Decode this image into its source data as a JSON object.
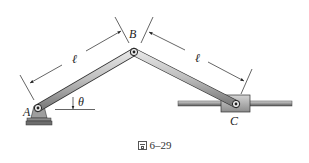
{
  "figure": {
    "caption_prefix": "图",
    "caption_number": "6–29",
    "points": {
      "A": "A",
      "B": "B",
      "C": "C"
    },
    "link_length_label_ab": "ℓ",
    "link_length_label_bc": "ℓ",
    "angle_label": "θ"
  }
}
